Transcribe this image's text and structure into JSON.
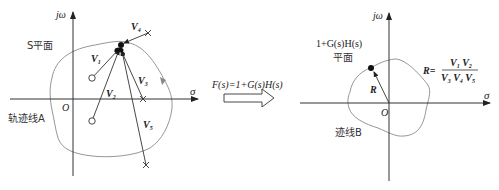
{
  "left_plane": {
    "axis_y_label": "jω",
    "axis_x_label": "σ",
    "origin_label": "O",
    "plane_label": "S平面",
    "contour_label": "轨迹线A",
    "vectors": [
      "V1",
      "V2",
      "V3",
      "V4",
      "V5"
    ],
    "vector_labels": {
      "v1_main": "V",
      "v1_sub": "1",
      "v2_main": "V",
      "v2_sub": "2",
      "v3_main": "V",
      "v3_sub": "3",
      "v4_main": "V",
      "v4_sub": "4",
      "v5_main": "V",
      "v5_sub": "5"
    },
    "zeros": 2,
    "poles": 3
  },
  "mapping": {
    "label": "F(s)=1+G(s)H(s)"
  },
  "right_plane": {
    "axis_y_label": "jω",
    "axis_x_label": "σ",
    "origin_label": "O",
    "plane_label_line1": "1+G(s)H(s)",
    "plane_label_line2": "平面",
    "contour_label": "迹线B",
    "vector_label": "R",
    "formula": {
      "lhs": "R=",
      "numerator": "V1 V2",
      "denominator": "V3 V4 V5"
    }
  },
  "colors": {
    "line": "#333333",
    "contour": "#8a8a8a",
    "arrow_gray": "#888888"
  }
}
